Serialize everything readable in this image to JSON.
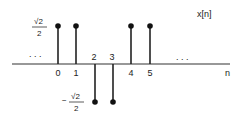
{
  "figure": {
    "signal_label": "x[n]",
    "axis_label": "n",
    "ellipsis_left": ". . .",
    "ellipsis_right": ". . .",
    "pos_value_label": {
      "num": "√2",
      "den": "2"
    },
    "neg_value_label": {
      "sign": "−",
      "num": "√2",
      "den": "2"
    }
  },
  "chart_data": {
    "type": "stem",
    "title": "x[n]",
    "xlabel": "n",
    "ylabel": "",
    "x": [
      0,
      1,
      2,
      3,
      4,
      5
    ],
    "values": [
      0.7071,
      0.7071,
      -0.7071,
      -0.7071,
      0.7071,
      0.7071
    ],
    "value_labels": [
      "√2/2",
      "√2/2",
      "−√2/2",
      "−√2/2",
      "√2/2",
      "√2/2"
    ],
    "tick_labels": [
      "0",
      "1",
      "2",
      "3",
      "4",
      "5"
    ],
    "annotations": [
      "... (continues left)",
      "... (continues right)"
    ],
    "grid": false
  }
}
